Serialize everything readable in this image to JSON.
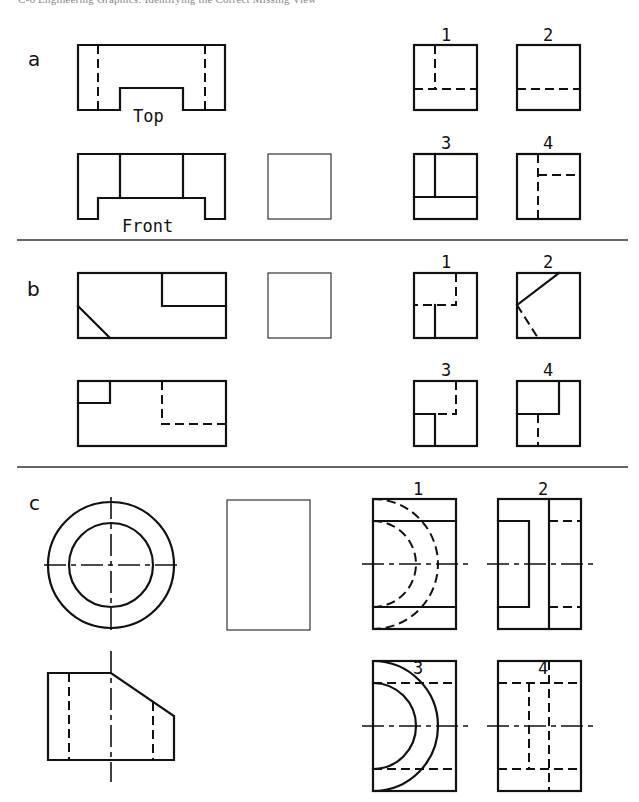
{
  "header": {
    "text": "C-6   Engineering Graphics: Identifying the Correct Missing View"
  },
  "sections": [
    {
      "id": "a",
      "label": "a",
      "view_labels": {
        "top": "Top",
        "front": "Front"
      },
      "given_views": [
        "top",
        "front"
      ],
      "missing_view": "right-side (blank box)",
      "choices": [
        "1",
        "2",
        "3",
        "4"
      ]
    },
    {
      "id": "b",
      "label": "b",
      "given_views": [
        "top",
        "front"
      ],
      "missing_view": "right-side (blank box)",
      "choices": [
        "1",
        "2",
        "3",
        "4"
      ]
    },
    {
      "id": "c",
      "label": "c",
      "given_views": [
        "top (concentric circles)",
        "front"
      ],
      "missing_view": "right-side (blank rectangle)",
      "choices": [
        "1",
        "2",
        "3",
        "4"
      ]
    }
  ],
  "colors": {
    "ink": "#111111",
    "background": "#ffffff",
    "divider": "#333333"
  }
}
